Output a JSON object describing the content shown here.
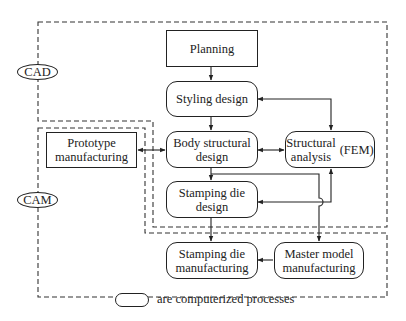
{
  "diagram": {
    "regions": [
      {
        "id": "cad",
        "label": "CAD"
      },
      {
        "id": "cam",
        "label": "CAM"
      }
    ],
    "nodes": {
      "planning": {
        "label": "Planning",
        "shape": "rectangle"
      },
      "styling_design": {
        "label": "Styling design",
        "shape": "rounded"
      },
      "body_structural_design": {
        "label_line1": "Body structural",
        "label_line2": "design",
        "shape": "rounded"
      },
      "structural_analysis": {
        "label_line1": "Structural",
        "label_line2": "analysis",
        "suffix": "(FEM)",
        "shape": "rounded"
      },
      "prototype_manufacturing": {
        "label_line1": "Prototype",
        "label_line2": "manufacturing",
        "shape": "rectangle"
      },
      "stamping_die_design": {
        "label_line1": "Stamping die",
        "label_line2": "design",
        "shape": "rounded"
      },
      "stamping_die_manufacturing": {
        "label_line1": "Stamping die",
        "label_line2": "manufacturing",
        "shape": "rounded"
      },
      "master_model_manufacturing": {
        "label_line1": "Master model",
        "label_line2": "manufacturing",
        "shape": "rounded"
      }
    },
    "edges": [
      {
        "from": "Planning",
        "to": "Styling design",
        "direction": "forward"
      },
      {
        "from": "Styling design",
        "to": "Body structural design",
        "direction": "forward"
      },
      {
        "from": "Styling design",
        "to": "Structural analysis (FEM)",
        "direction": "both"
      },
      {
        "from": "Prototype manufacturing",
        "to": "Body structural design",
        "direction": "both"
      },
      {
        "from": "Body structural design",
        "to": "Structural analysis (FEM)",
        "direction": "both"
      },
      {
        "from": "Body structural design",
        "to": "Stamping die design",
        "direction": "forward"
      },
      {
        "from": "Body structural design",
        "to": "Master model manufacturing",
        "direction": "forward"
      },
      {
        "from": "Stamping die design",
        "to": "Structural analysis (FEM)",
        "direction": "both"
      },
      {
        "from": "Stamping die design",
        "to": "Stamping die manufacturing",
        "direction": "forward"
      },
      {
        "from": "Master model manufacturing",
        "to": "Stamping die manufacturing",
        "direction": "forward"
      }
    ],
    "legend": {
      "text": "are computerized processes",
      "symbol": "rounded-rectangle"
    }
  }
}
